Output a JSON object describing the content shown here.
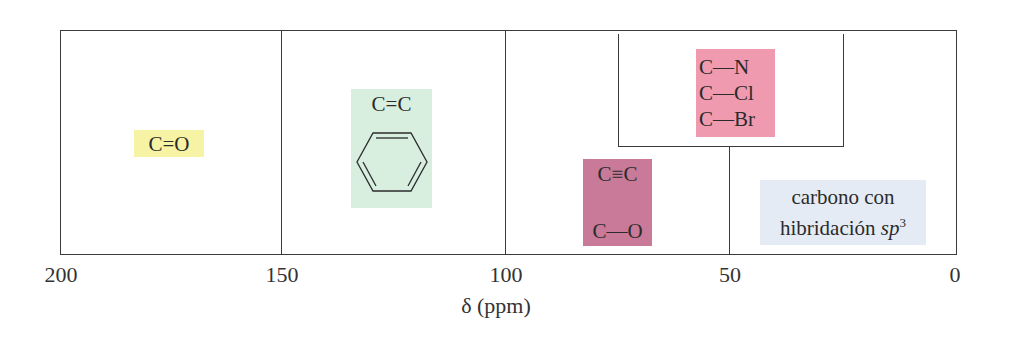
{
  "diagram": {
    "axis": {
      "label": "δ (ppm)",
      "ticks": [
        "200",
        "150",
        "100",
        "50",
        "0"
      ]
    },
    "regions": [
      {
        "id": "carbonyl",
        "labels": [
          "C=O"
        ],
        "range_ppm": [
          150,
          200
        ],
        "color": "#f7f3a4"
      },
      {
        "id": "alkene-aromatic",
        "labels": [
          "C=C",
          "benzene ring"
        ],
        "range_ppm": [
          100,
          150
        ],
        "color": "#d8efe0"
      },
      {
        "id": "heteroatom",
        "labels": [
          "C—N",
          "C—Cl",
          "C—Br"
        ],
        "range_ppm": [
          25,
          75
        ],
        "color": "#f09ab0"
      },
      {
        "id": "alkyne-ether",
        "labels": [
          "C≡C",
          "C—O"
        ],
        "range_ppm": [
          50,
          100
        ],
        "color": "#c87a98"
      },
      {
        "id": "sp3",
        "labels": [
          "carbono con",
          "hibridación",
          "sp",
          "3"
        ],
        "range_ppm": [
          0,
          50
        ],
        "color": "#e4ebf5"
      }
    ]
  }
}
